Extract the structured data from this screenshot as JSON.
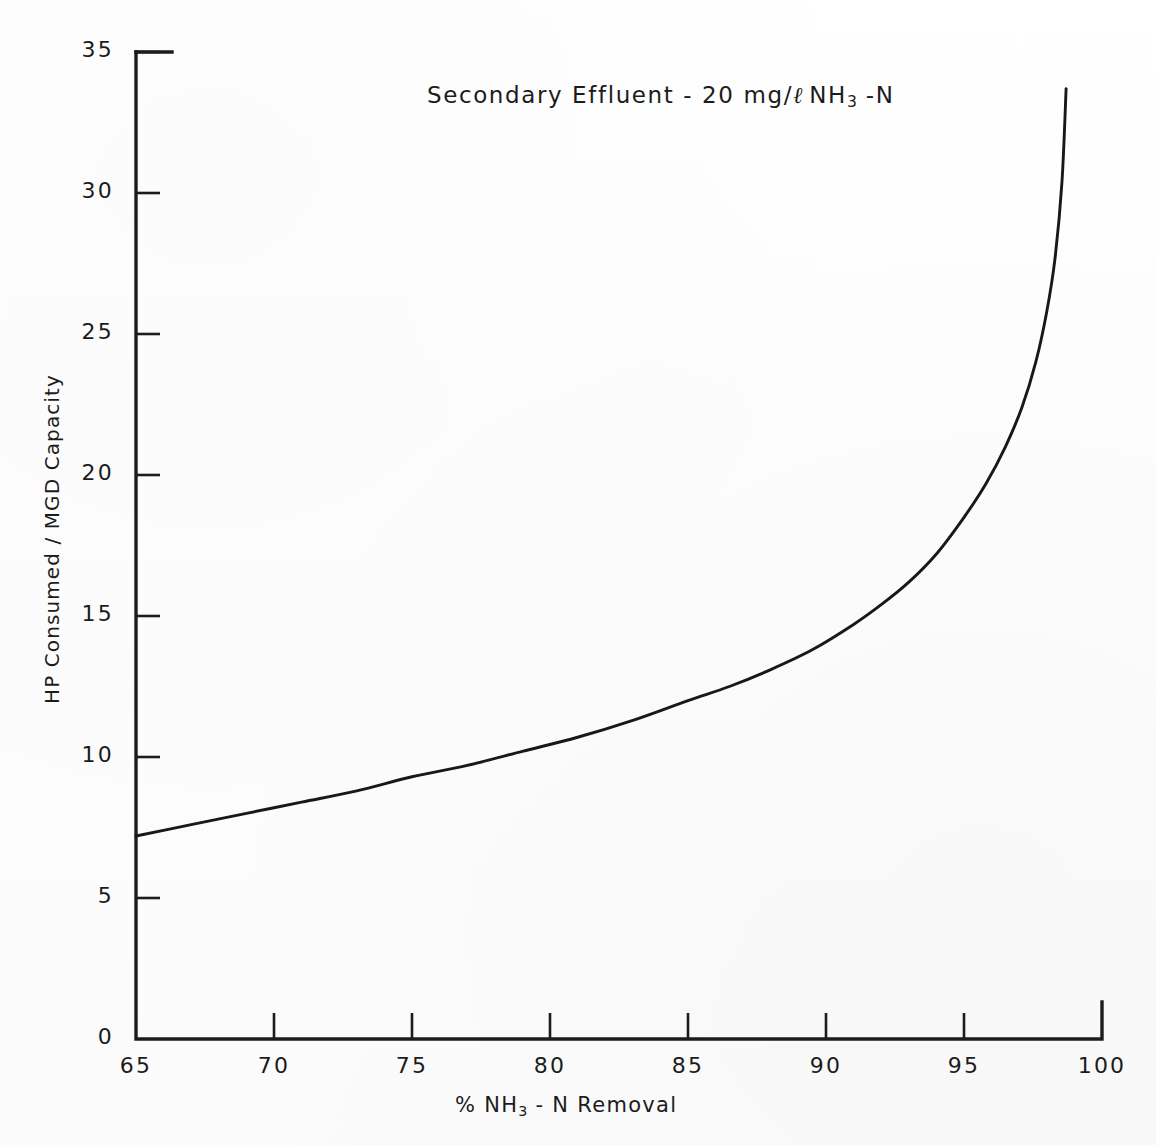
{
  "chart_data": {
    "type": "line",
    "title_parts": {
      "prefix": "Secondary Effluent - 20 ",
      "unit_mg": "mg/",
      "unit_liter": "ℓ",
      "species": "NH",
      "species_sub": "3",
      "suffix": " -N"
    },
    "xlabel": "% NH₃ - N Removal",
    "xlabel_parts": {
      "prefix": "% NH",
      "sub": "3",
      "suffix": " - N Removal"
    },
    "ylabel": "HP Consumed / MGD Capacity",
    "xlim": [
      65,
      100
    ],
    "ylim": [
      0,
      35
    ],
    "xticks": [
      65,
      70,
      75,
      80,
      85,
      90,
      95,
      100
    ],
    "yticks": [
      0,
      5,
      10,
      15,
      20,
      25,
      30,
      35
    ],
    "xtick_labels": [
      "65",
      "70",
      "75",
      "80",
      "85",
      "90",
      "95",
      "100"
    ],
    "ytick_labels": [
      "0",
      "5",
      "10",
      "15",
      "20",
      "25",
      "30",
      "35"
    ],
    "grid": false,
    "legend": null,
    "legend_position": "none",
    "line_color": "#181818",
    "background_color": "#ffffff",
    "series": [
      {
        "name": "HP Consumed per MGD Capacity",
        "x": [
          65.0,
          67.0,
          69.0,
          71.0,
          73.0,
          75.0,
          77.0,
          79.0,
          81.0,
          83.0,
          85.0,
          86.5,
          88.0,
          89.5,
          91.0,
          92.0,
          93.0,
          94.0,
          95.0,
          95.8,
          96.5,
          97.1,
          97.6,
          98.0,
          98.3,
          98.55,
          98.7
        ],
        "y": [
          7.2,
          7.6,
          8.0,
          8.4,
          8.8,
          9.3,
          9.7,
          10.2,
          10.7,
          11.3,
          12.0,
          12.5,
          13.1,
          13.8,
          14.7,
          15.4,
          16.2,
          17.2,
          18.5,
          19.7,
          21.0,
          22.4,
          24.0,
          25.8,
          27.7,
          30.4,
          33.7
        ]
      }
    ],
    "annotations": []
  },
  "axes": {
    "x_axis_name": "x-axis",
    "y_axis_name": "y-axis"
  }
}
